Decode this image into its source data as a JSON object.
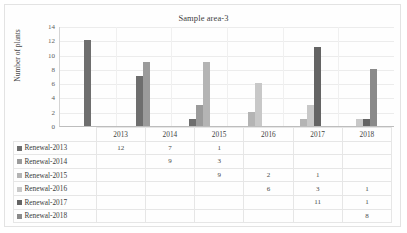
{
  "chart_data": {
    "type": "bar",
    "title": "Sample area-3",
    "xlabel": "",
    "ylabel": "Number of plants",
    "ylim": [
      0,
      14
    ],
    "ytick_step": 2,
    "yticks": [
      0,
      2,
      4,
      6,
      8,
      10,
      12,
      14
    ],
    "grid": true,
    "legend_position": "data-table",
    "categories": [
      "2013",
      "2014",
      "2015",
      "2016",
      "2017",
      "2018"
    ],
    "series": [
      {
        "name": "Renewal-2013",
        "color": "#6e6e6e",
        "values": [
          12,
          7,
          1,
          null,
          null,
          null
        ]
      },
      {
        "name": "Renewal-2014",
        "color": "#9b9b9b",
        "values": [
          null,
          9,
          3,
          null,
          null,
          null
        ]
      },
      {
        "name": "Renewal-2015",
        "color": "#b4b4b4",
        "values": [
          null,
          null,
          9,
          2,
          1,
          null
        ]
      },
      {
        "name": "Renewal-2016",
        "color": "#c8c8c8",
        "values": [
          null,
          null,
          null,
          6,
          3,
          1
        ]
      },
      {
        "name": "Renewal-2017",
        "color": "#646464",
        "values": [
          null,
          null,
          null,
          null,
          11,
          1
        ]
      },
      {
        "name": "Renewal-2018",
        "color": "#8a8a8a",
        "values": [
          null,
          null,
          null,
          null,
          null,
          8
        ]
      }
    ],
    "table": {
      "column_headers": [
        "2013",
        "2014",
        "2015",
        "2016",
        "2017",
        "2018"
      ],
      "rows": [
        {
          "label": "Renewal-2013",
          "cells": [
            "12",
            "7",
            "1",
            "",
            "",
            ""
          ]
        },
        {
          "label": "Renewal-2014",
          "cells": [
            "",
            "9",
            "3",
            "",
            "",
            ""
          ]
        },
        {
          "label": "Renewal-2015",
          "cells": [
            "",
            "",
            "9",
            "2",
            "1",
            ""
          ]
        },
        {
          "label": "Renewal-2016",
          "cells": [
            "",
            "",
            "",
            "6",
            "3",
            "1"
          ]
        },
        {
          "label": "Renewal-2017",
          "cells": [
            "",
            "",
            "",
            "",
            "11",
            "1"
          ]
        },
        {
          "label": "Renewal-2018",
          "cells": [
            "",
            "",
            "",
            "",
            "",
            "8"
          ]
        }
      ]
    }
  }
}
